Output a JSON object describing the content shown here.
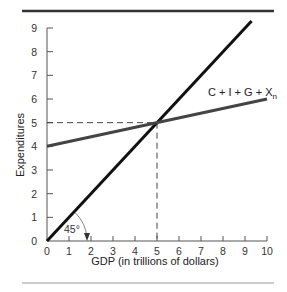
{
  "chart_data": {
    "type": "line",
    "title": "",
    "xlabel": "GDP (in trillions of dollars)",
    "ylabel": "Expenditures",
    "xlim": [
      0,
      10
    ],
    "ylim": [
      0,
      9
    ],
    "x_ticks": [
      "0",
      "1",
      "2",
      "3",
      "4",
      "5",
      "6",
      "7",
      "8",
      "9",
      "10"
    ],
    "y_ticks": [
      "0",
      "1",
      "2",
      "3",
      "4",
      "5",
      "6",
      "7",
      "8",
      "9"
    ],
    "grid": false,
    "series": [
      {
        "name": "45° line",
        "x": [
          0,
          9.3
        ],
        "y": [
          0,
          9.3
        ]
      },
      {
        "name": "C + I + G + Xn",
        "x": [
          0,
          10
        ],
        "y": [
          4,
          6
        ]
      }
    ],
    "annotations": [
      {
        "text": "45°",
        "x": 1.3,
        "y": 0.5
      },
      {
        "text": "C + I + G + Xn",
        "x": 7.5,
        "y": 6.6
      },
      {
        "type": "dashed-guide",
        "x": 5,
        "y": 5
      }
    ],
    "equilibrium": {
      "x": 5,
      "y": 5
    }
  },
  "labels": {
    "xlabel": "GDP (in trillions of dollars)",
    "ylabel": "Expenditures",
    "series_label_main": "C + I + G + X",
    "series_label_sub": "n",
    "angle_label": "45°"
  }
}
